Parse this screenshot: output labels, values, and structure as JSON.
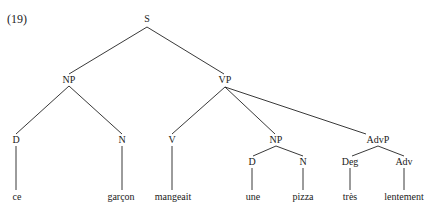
{
  "example_number": "(19)",
  "tree": {
    "root": "S",
    "nodes": {
      "S": "S",
      "NP_subject": "NP",
      "VP": "VP",
      "D_subject": "D",
      "N_subject": "N",
      "V": "V",
      "NP_object": "NP",
      "AdvP": "AdvP",
      "D_object": "D",
      "N_object": "N",
      "Deg": "Deg",
      "Adv": "Adv"
    },
    "leaves": {
      "ce": "ce",
      "garcon": "garçon",
      "mangeait": "mangeait",
      "une": "une",
      "pizza": "pizza",
      "tres": "très",
      "lentement": "lentement"
    },
    "bracketing": "[S [NP [D ce] [N garçon]] [VP [V mangeait] [NP [D une] [N pizza]] [AdvP [Deg très] [Adv lentement]]]]"
  }
}
